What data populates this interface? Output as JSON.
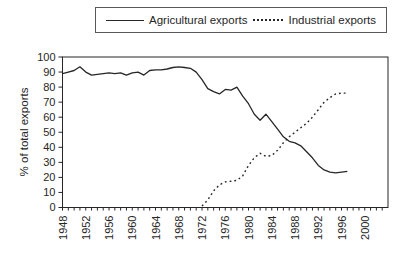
{
  "colors": {
    "ink": "#262626",
    "background": "#ffffff",
    "legend_border": "#595959"
  },
  "chart_data": {
    "type": "line",
    "title": "",
    "xlabel": "",
    "ylabel": "% of total exports",
    "ylim": [
      0,
      100
    ],
    "ytick_step": 10,
    "xlim": [
      1948,
      2004
    ],
    "xtick_labels": [
      1948,
      1952,
      1956,
      1960,
      1964,
      1968,
      1972,
      1976,
      1980,
      1984,
      1988,
      1992,
      1996,
      2000
    ],
    "grid": false,
    "legend_position": "top",
    "series": [
      {
        "name": "Agricultural exports",
        "line_style": "solid",
        "x": [
          1948,
          1949,
          1950,
          1951,
          1952,
          1953,
          1954,
          1955,
          1956,
          1957,
          1958,
          1959,
          1960,
          1961,
          1962,
          1963,
          1964,
          1965,
          1966,
          1967,
          1968,
          1969,
          1970,
          1971,
          1972,
          1973,
          1974,
          1975,
          1976,
          1977,
          1978,
          1979,
          1980,
          1981,
          1982,
          1983,
          1984,
          1985,
          1986,
          1987,
          1988,
          1989,
          1990,
          1991,
          1992,
          1993,
          1994,
          1995,
          1996,
          1997
        ],
        "values": [
          89,
          90,
          91,
          93.5,
          90,
          88,
          88.5,
          89,
          89.5,
          89,
          89.5,
          88,
          89.5,
          90,
          88,
          91,
          91.5,
          91.5,
          92,
          93,
          93.5,
          93,
          92.5,
          90,
          85,
          79,
          77,
          75.5,
          78.5,
          78,
          80,
          74,
          69,
          62,
          58,
          62,
          57,
          52,
          47,
          44,
          43,
          41,
          37,
          33,
          28,
          25,
          23.5,
          23,
          23.5,
          24
        ]
      },
      {
        "name": "Industrial exports",
        "line_style": "dotted",
        "x": [
          1972,
          1973,
          1974,
          1975,
          1976,
          1977,
          1978,
          1979,
          1980,
          1981,
          1982,
          1983,
          1984,
          1985,
          1986,
          1987,
          1988,
          1989,
          1990,
          1991,
          1992,
          1993,
          1994,
          1995,
          1996,
          1997
        ],
        "values": [
          1,
          5,
          11,
          15,
          17,
          17.5,
          18,
          21,
          28,
          33,
          36,
          34,
          34.5,
          38,
          43,
          47,
          50,
          53,
          56,
          60,
          65,
          70,
          73,
          75.5,
          76,
          76
        ]
      }
    ]
  }
}
